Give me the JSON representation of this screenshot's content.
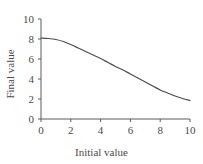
{
  "chart_data": {
    "type": "line",
    "title": "",
    "xlabel": "Initial value",
    "ylabel": "Final value",
    "xlim": [
      0,
      10
    ],
    "ylim": [
      0,
      10
    ],
    "xticks": [
      0,
      2,
      4,
      6,
      8,
      10
    ],
    "yticks": [
      0,
      2,
      4,
      6,
      8,
      10
    ],
    "xtick_labels": [
      "0",
      "2",
      "4",
      "6",
      "8",
      "10"
    ],
    "ytick_labels": [
      "0",
      "2",
      "4",
      "6",
      "8",
      "10"
    ],
    "grid": false,
    "legend": null,
    "series": [
      {
        "name": "final vs initial",
        "color": "#4d4d4d",
        "line_width": 1.2,
        "x": [
          0,
          0.5,
          1,
          1.5,
          2,
          2.5,
          3,
          3.5,
          4,
          4.5,
          5,
          5.5,
          6,
          6.5,
          7,
          7.5,
          8,
          8.5,
          9,
          9.5,
          10
        ],
        "y": [
          8.1,
          8.05,
          7.95,
          7.75,
          7.45,
          7.1,
          6.75,
          6.4,
          6.05,
          5.65,
          5.25,
          4.9,
          4.5,
          4.1,
          3.7,
          3.3,
          2.9,
          2.6,
          2.3,
          2.05,
          1.85
        ]
      }
    ]
  },
  "axes": {
    "spine_color": "#5a5a5a",
    "background": "#ffffff"
  }
}
